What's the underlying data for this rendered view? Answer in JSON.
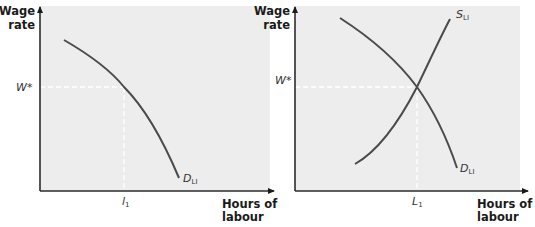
{
  "colors": {
    "panel_bg": "#ededed",
    "axis": "#2b2b2b",
    "curve": "#4a4a4a",
    "guide": "#ffffff"
  },
  "panels": [
    {
      "id": "left",
      "y_axis_label": [
        "Wage",
        "rate"
      ],
      "x_axis_label": [
        "Hours of",
        "labour"
      ],
      "wage_label": "W*",
      "quantity_label": {
        "main": "l",
        "sub": "1"
      },
      "curves": [
        {
          "name": "demand",
          "label": {
            "main": "D",
            "sub": "LI"
          }
        }
      ]
    },
    {
      "id": "right",
      "y_axis_label": [
        "Wage",
        "rate"
      ],
      "x_axis_label": [
        "Hours of",
        "labour"
      ],
      "wage_label": "W*",
      "quantity_label": {
        "main": "L",
        "sub": "1"
      },
      "curves": [
        {
          "name": "supply",
          "label": {
            "main": "S",
            "sub": "LI"
          }
        },
        {
          "name": "demand",
          "label": {
            "main": "D",
            "sub": "LI"
          }
        }
      ]
    }
  ]
}
